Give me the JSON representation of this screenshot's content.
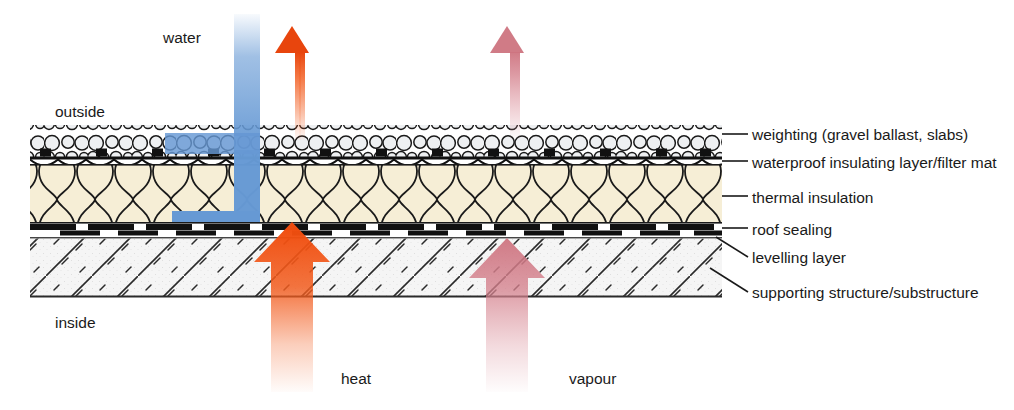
{
  "diagram": {
    "environment": {
      "outside_label": "outside",
      "inside_label": "inside"
    },
    "flows": [
      {
        "id": "water",
        "label": "water",
        "color": "#6699D4"
      },
      {
        "id": "heat",
        "label": "heat",
        "color": "#F25C1E"
      },
      {
        "id": "vapour",
        "label": "vapour",
        "color": "#D98B96"
      }
    ],
    "layers": [
      {
        "id": "weighting",
        "label": "weighting (gravel ballast, slabs)",
        "y_top": 125,
        "y_bottom": 158,
        "fill": "#f2f2f2"
      },
      {
        "id": "filter-mat",
        "label": "waterproof insulating layer/filter mat",
        "y_top": 158,
        "y_bottom": 165,
        "fill": "#111111"
      },
      {
        "id": "thermal",
        "label": "thermal insulation",
        "y_top": 165,
        "y_bottom": 222,
        "fill": "#f6eed6"
      },
      {
        "id": "sealing",
        "label": "roof sealing",
        "y_top": 222,
        "y_bottom": 230,
        "fill": "#111111"
      },
      {
        "id": "levelling",
        "label": "levelling layer",
        "y_top": 230,
        "y_bottom": 238,
        "fill": "#ffffff"
      },
      {
        "id": "substructure",
        "label": "supporting structure/substructure",
        "y_top": 238,
        "y_bottom": 297,
        "fill": "#f4f4f4"
      }
    ],
    "colors": {
      "water_blue": "#6699D4",
      "heat_orange": "#F25C1E",
      "vapour_pink": "#D98B96",
      "insulation_cream": "#f6eed6",
      "ink": "#1a1a1a",
      "leader": "#1a1a1a"
    },
    "geometry": {
      "build_left": 30,
      "build_right": 722,
      "leader_x_end": 745
    }
  }
}
